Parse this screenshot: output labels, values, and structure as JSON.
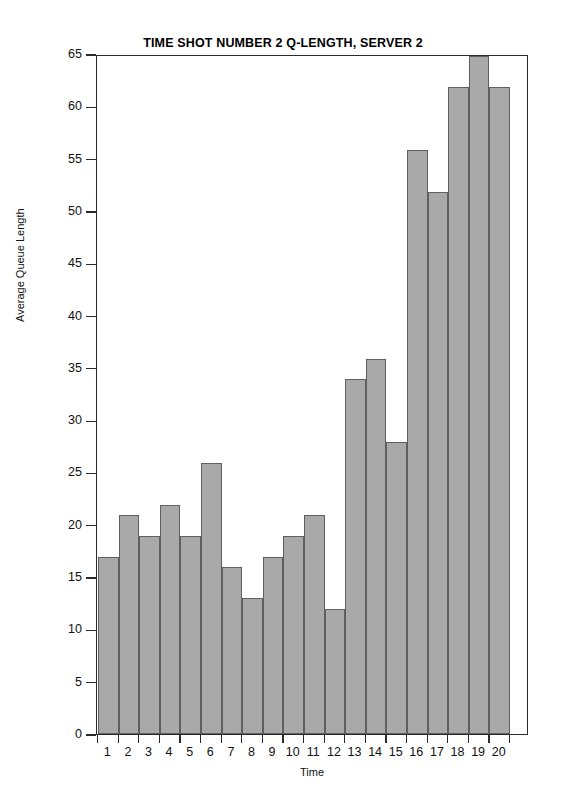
{
  "chart_data": {
    "type": "bar",
    "title": "TIME SHOT NUMBER 2 Q-LENGTH, SERVER 2",
    "xlabel": "Time",
    "ylabel": "Average Queue Length",
    "categories": [
      "1",
      "2",
      "3",
      "4",
      "5",
      "6",
      "7",
      "8",
      "9",
      "10",
      "11",
      "12",
      "13",
      "14",
      "15",
      "16",
      "17",
      "18",
      "19",
      "20"
    ],
    "values": [
      17,
      21,
      19,
      22,
      19,
      26,
      16,
      13,
      17,
      19,
      21,
      12,
      34,
      36,
      28,
      56,
      52,
      62,
      65,
      62
    ],
    "ylim": [
      0,
      65
    ],
    "ytick_labels": [
      "0",
      "5",
      "10",
      "15",
      "20",
      "25",
      "30",
      "35",
      "40",
      "45",
      "50",
      "55",
      "60",
      "65"
    ],
    "ytick_values": [
      0,
      5,
      10,
      15,
      20,
      25,
      30,
      35,
      40,
      45,
      50,
      55,
      60,
      65
    ],
    "grid": false,
    "legend": null,
    "bar_fill_color": "#a9a9a9",
    "bar_edge_color": "#5f5f5f",
    "axis_color": "#2b2b2b",
    "background_color": "#ffffff"
  }
}
